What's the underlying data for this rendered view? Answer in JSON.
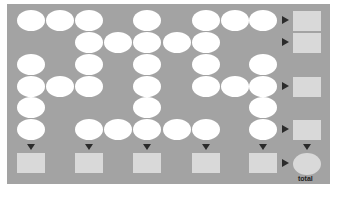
{
  "diagram": {
    "background_color": "#a3a3a3",
    "oval_color": "#ffffff",
    "box_color": "#d9d9d9",
    "arrow_color": "#2b2b2b",
    "grid": {
      "columns": 9,
      "rows": 6,
      "filled": [
        [
          1,
          1,
          1,
          0,
          1,
          0,
          1,
          1,
          1
        ],
        [
          0,
          0,
          1,
          1,
          1,
          1,
          1,
          0,
          0
        ],
        [
          1,
          0,
          1,
          0,
          1,
          0,
          1,
          0,
          1
        ],
        [
          1,
          1,
          1,
          0,
          1,
          0,
          1,
          1,
          1
        ],
        [
          1,
          0,
          0,
          0,
          1,
          0,
          0,
          0,
          1
        ],
        [
          1,
          0,
          1,
          1,
          1,
          1,
          1,
          0,
          1
        ]
      ]
    },
    "row_outputs": [
      true,
      true,
      false,
      true,
      false,
      true
    ],
    "column_outputs": [
      0,
      2,
      4,
      6,
      8
    ],
    "total_label": "total"
  }
}
